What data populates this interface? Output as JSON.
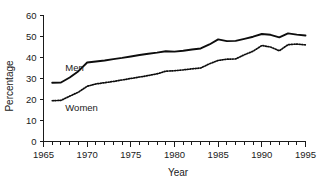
{
  "chart_data": {
    "type": "line",
    "title": "",
    "xlabel": "Year",
    "ylabel": "Percentage",
    "xlim": [
      1965,
      1995
    ],
    "ylim": [
      0,
      60
    ],
    "grid": false,
    "legend_position": "inline-annotation",
    "x_major_ticks": [
      1965,
      1970,
      1975,
      1980,
      1985,
      1990,
      1995
    ],
    "x_minor_tick_interval": 1,
    "y_ticks": [
      0,
      10,
      20,
      30,
      40,
      50,
      60
    ],
    "x_tick_labels": [
      "1965",
      "1970",
      "1975",
      "1980",
      "1985",
      "1990",
      "1995"
    ],
    "y_tick_labels": [
      "0",
      "10",
      "20",
      "30",
      "40",
      "50",
      "60"
    ],
    "annotations": [
      {
        "text": "Men",
        "x": 1967.5,
        "y": 33.5
      },
      {
        "text": "Women",
        "x": 1967.5,
        "y": 14.5
      }
    ],
    "x": [
      1966,
      1967,
      1968,
      1969,
      1970,
      1971,
      1972,
      1973,
      1974,
      1975,
      1976,
      1977,
      1978,
      1979,
      1980,
      1981,
      1982,
      1983,
      1984,
      1985,
      1986,
      1987,
      1988,
      1989,
      1990,
      1991,
      1992,
      1993,
      1994,
      1995
    ],
    "series": [
      {
        "name": "Men",
        "style": "solid",
        "values": [
          28.0,
          28.1,
          30.5,
          33.5,
          37.6,
          38.1,
          38.6,
          39.2,
          39.8,
          40.5,
          41.2,
          41.8,
          42.3,
          43.0,
          42.8,
          43.2,
          43.8,
          44.3,
          46.2,
          48.6,
          47.8,
          47.9,
          48.9,
          49.9,
          51.2,
          50.8,
          49.6,
          51.5,
          50.9,
          50.5
        ]
      },
      {
        "name": "Women",
        "style": "dotted",
        "values": [
          19.4,
          19.6,
          21.6,
          23.5,
          26.3,
          27.4,
          28.0,
          28.6,
          29.3,
          30.0,
          30.7,
          31.4,
          32.2,
          33.5,
          33.7,
          34.1,
          34.6,
          35.0,
          37.0,
          38.6,
          39.2,
          39.3,
          41.3,
          43.0,
          45.7,
          45.0,
          43.2,
          46.1,
          46.4,
          46.0
        ]
      }
    ]
  },
  "colors": {
    "axis": "#1a1a1a",
    "series_men": "#0d0d0d",
    "series_women": "#0d0d0d",
    "background": "#ffffff"
  }
}
